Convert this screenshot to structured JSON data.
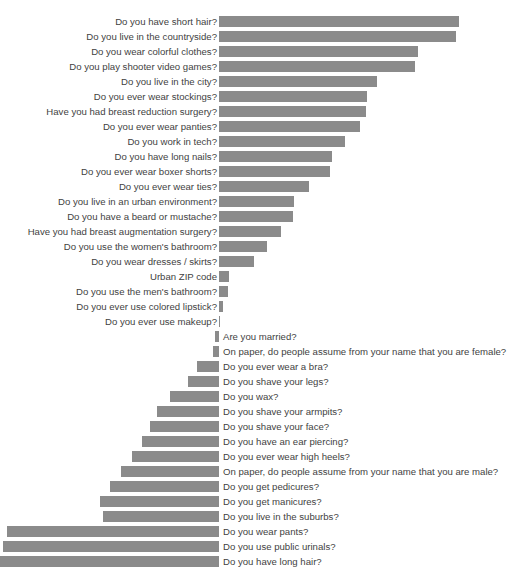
{
  "chart_data": {
    "type": "bar",
    "orientation": "horizontal",
    "title": "",
    "xlabel": "",
    "ylabel": "",
    "grid": false,
    "legend": false,
    "axis_zero_x_px": 219,
    "bar_color": "#8b8b8b",
    "label_color": "#3f3f3f",
    "background": "#ffffff",
    "xlim": [
      -100,
      100
    ],
    "note": "Diverging horizontal bar chart. Positive values extend right of the zero line with labels on the left; negative values extend left of the zero line with labels on the right.",
    "categories": [
      "Do you have short hair?",
      "Do you live in the countryside?",
      "Do you wear colorful clothes?",
      "Do you play shooter video games?",
      "Do you live in the city?",
      "Do you ever wear stockings?",
      "Have you had breast reduction surgery?",
      "Do you ever wear panties?",
      "Do you work in tech?",
      "Do you have long nails?",
      "Do you ever wear boxer shorts?",
      "Do you ever wear ties?",
      "Do you live in an urban environment?",
      "Do you have a beard or mustache?",
      "Have you had breast augmentation surgery?",
      "Do you use the women's bathroom?",
      "Do you wear dresses / skirts?",
      "Urban ZIP code",
      "Do you use the men's bathroom?",
      "Do you ever use colored lipstick?",
      "Do you ever use makeup?",
      "Are you married?",
      "On paper, do people assume from your name that you are female?",
      "Do you ever wear a bra?",
      "Do you shave your legs?",
      "Do you wax?",
      "Do you shave your armpits?",
      "Do you shave your face?",
      "Do you have an ear piercing?",
      "Do you ever wear high heels?",
      "On paper, do people assume from your name that you are male?",
      "Do you get pedicures?",
      "Do you get manicures?",
      "Do you live in the suburbs?",
      "Do you wear pants?",
      "Do you use public urinals?",
      "Do you have long hair?"
    ],
    "values": [
      78.4,
      77.2,
      64.9,
      63.9,
      51.5,
      48.3,
      48.0,
      45.9,
      41.2,
      36.9,
      36.3,
      29.2,
      24.4,
      24.1,
      20.3,
      15.7,
      11.3,
      3.4,
      2.9,
      1.3,
      0.4,
      -1.3,
      -2.1,
      -7.3,
      -10.0,
      -16.1,
      -20.4,
      -22.7,
      -25.2,
      -28.5,
      -32.0,
      -35.5,
      -39.0,
      -47.8,
      -85.5,
      -87.2,
      -89.8
    ],
    "bar_px": [
      {
        "start": 219,
        "width": 240
      },
      {
        "start": 219,
        "width": 237
      },
      {
        "start": 219,
        "width": 199
      },
      {
        "start": 219,
        "width": 196
      },
      {
        "start": 219,
        "width": 158
      },
      {
        "start": 219,
        "width": 148
      },
      {
        "start": 219,
        "width": 147
      },
      {
        "start": 219,
        "width": 141
      },
      {
        "start": 219,
        "width": 126
      },
      {
        "start": 219,
        "width": 113
      },
      {
        "start": 219,
        "width": 111
      },
      {
        "start": 219,
        "width": 90
      },
      {
        "start": 219,
        "width": 75
      },
      {
        "start": 219,
        "width": 74
      },
      {
        "start": 219,
        "width": 62
      },
      {
        "start": 219,
        "width": 48
      },
      {
        "start": 219,
        "width": 35
      },
      {
        "start": 219,
        "width": 10
      },
      {
        "start": 219,
        "width": 9
      },
      {
        "start": 219,
        "width": 4
      },
      {
        "start": 219,
        "width": 1
      },
      {
        "start": 215,
        "width": 4
      },
      {
        "start": 213,
        "width": 6
      },
      {
        "start": 197,
        "width": 22
      },
      {
        "start": 188,
        "width": 31
      },
      {
        "start": 170,
        "width": 49
      },
      {
        "start": 157,
        "width": 62
      },
      {
        "start": 150,
        "width": 69
      },
      {
        "start": 142,
        "width": 77
      },
      {
        "start": 132,
        "width": 87
      },
      {
        "start": 121,
        "width": 98
      },
      {
        "start": 110,
        "width": 109
      },
      {
        "start": 100,
        "width": 119
      },
      {
        "start": 103,
        "width": 116
      },
      {
        "start": 7,
        "width": 212
      },
      {
        "start": 3,
        "width": 216
      },
      {
        "start": 0,
        "width": 219
      }
    ]
  },
  "layout": {
    "row_height": 15,
    "top_offset": 14,
    "bar_height": 11
  }
}
